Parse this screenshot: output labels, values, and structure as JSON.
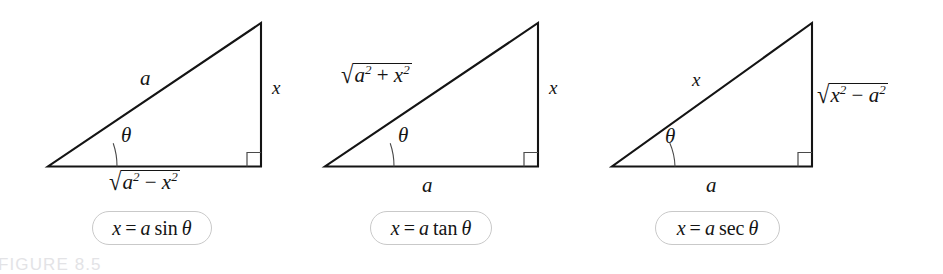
{
  "figure": {
    "caption": "FIGURE 8.5",
    "caption_color": "#e3e3e6",
    "stroke_color": "#141414",
    "box_border_color": "#c9c9c9",
    "background": "#ffffff"
  },
  "panels": [
    {
      "id": "panel-sine",
      "hypotenuse_label": "a",
      "vertical_label": "x",
      "base_label_radical": {
        "sign": "√",
        "radicand_parts": [
          {
            "text": "a",
            "style": "italic"
          },
          {
            "text": "2",
            "style": "sup"
          },
          {
            "text": " − ",
            "style": "op"
          },
          {
            "text": "x",
            "style": "italic"
          },
          {
            "text": "2",
            "style": "sup"
          }
        ],
        "plain": "√(a² − x²)"
      },
      "angle_label": "θ",
      "right_angle_marker": true,
      "formula": {
        "plain": "x = a sin θ",
        "lhs": "x",
        "equals": "=",
        "coefficient": "a",
        "function": "sin",
        "argument": "θ"
      }
    },
    {
      "id": "panel-tangent",
      "hypotenuse_label_radical": {
        "sign": "√",
        "radicand_parts": [
          {
            "text": "a",
            "style": "italic"
          },
          {
            "text": "2",
            "style": "sup"
          },
          {
            "text": " + ",
            "style": "op"
          },
          {
            "text": "x",
            "style": "italic"
          },
          {
            "text": "2",
            "style": "sup"
          }
        ],
        "plain": "√(a² + x²)"
      },
      "vertical_label": "x",
      "base_label": "a",
      "angle_label": "θ",
      "right_angle_marker": true,
      "formula": {
        "plain": "x = a tan θ",
        "lhs": "x",
        "equals": "=",
        "coefficient": "a",
        "function": "tan",
        "argument": "θ"
      }
    },
    {
      "id": "panel-secant",
      "hypotenuse_label": "x",
      "vertical_label_radical": {
        "sign": "√",
        "radicand_parts": [
          {
            "text": "x",
            "style": "italic"
          },
          {
            "text": "2",
            "style": "sup"
          },
          {
            "text": " − ",
            "style": "op"
          },
          {
            "text": "a",
            "style": "italic"
          },
          {
            "text": "2",
            "style": "sup"
          }
        ],
        "plain": "√(x² − a²)"
      },
      "base_label": "a",
      "angle_label": "θ",
      "right_angle_marker": true,
      "formula": {
        "plain": "x = a sec θ",
        "lhs": "x",
        "equals": "=",
        "coefficient": "a",
        "function": "sec",
        "argument": "θ"
      }
    }
  ]
}
